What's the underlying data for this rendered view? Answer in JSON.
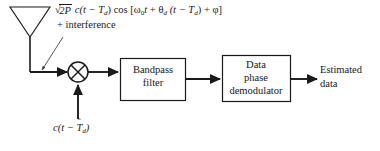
{
  "diagram": {
    "background_color": "#ffffff",
    "line_color": "#1a1a1a",
    "text_color": "#1a1a1a",
    "annotations": {
      "signal_equation": "√2P c(t − T_d) cos [ω₀t + θ_d (t − T_d) + φ]",
      "interference": "+ interference",
      "local_code": "c(t − T̂_d)",
      "output": "Estimated data",
      "output_line1": "Estimated",
      "output_line2": "data"
    },
    "blocks": [
      {
        "id": "bandpass-filter",
        "label": "Bandpass filter",
        "line1": "Bandpass",
        "line2": "filter",
        "shape": "rectangle"
      },
      {
        "id": "data-phase-demodulator",
        "label": "Data phase demodulator",
        "line1": "Data",
        "line2": "phase",
        "line3": "demodulator",
        "shape": "rectangle"
      }
    ],
    "components": [
      {
        "id": "antenna",
        "label": "antenna",
        "shape": "inverted-triangle-with-mast"
      },
      {
        "id": "mixer",
        "label": "mixer",
        "shape": "circle-with-cross"
      }
    ],
    "equation_parts": {
      "sqrt_radicand": "2P",
      "envelope": "c(t − T",
      "envelope_sub": "d",
      "cos_open": ") cos [",
      "omega": "ω",
      "omega_sub": "0",
      "omega_t": "t",
      "plus": "+",
      "theta": "θ",
      "theta_sub": "d",
      "theta_arg": "(t − T",
      "theta_arg_sub": "d",
      "phase_close": ") + φ]"
    },
    "local_code_parts": {
      "prefix": "c(t − ",
      "hat_base": "T",
      "hat_mark": "ˆ",
      "sub": "d",
      "suffix": ")"
    }
  }
}
